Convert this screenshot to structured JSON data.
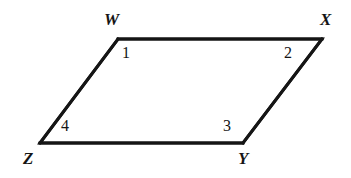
{
  "figure": {
    "kind": "geometry-diagram",
    "shape_name": "parallelogram",
    "background_color": "#ffffff",
    "stroke_color": "#151515",
    "stroke_width": 3,
    "canvas": {
      "width": 351,
      "height": 178
    },
    "vertices": [
      {
        "id": "W",
        "label": "W",
        "x": 118,
        "y": 39,
        "label_x": 104,
        "label_y": 11
      },
      {
        "id": "X",
        "label": "X",
        "x": 322,
        "y": 39,
        "label_x": 320,
        "label_y": 11
      },
      {
        "id": "Y",
        "label": "Y",
        "x": 243,
        "y": 143,
        "label_x": 238,
        "label_y": 150
      },
      {
        "id": "Z",
        "label": "Z",
        "x": 40,
        "y": 143,
        "label_x": 23,
        "label_y": 150
      }
    ],
    "outline_path": "M 118 39 L 322 39 L 243 143 L 40 143 Z",
    "edges": [
      {
        "id": "WX",
        "from": "W",
        "to": "X"
      },
      {
        "id": "XY",
        "from": "X",
        "to": "Y"
      },
      {
        "id": "YZ",
        "from": "Y",
        "to": "Z"
      },
      {
        "id": "ZW",
        "from": "Z",
        "to": "W"
      }
    ],
    "angles": [
      {
        "id": "angle-1",
        "label": "1",
        "at_vertex": "W",
        "label_x": 122,
        "label_y": 45
      },
      {
        "id": "angle-2",
        "label": "2",
        "at_vertex": "X",
        "label_x": 284,
        "label_y": 45
      },
      {
        "id": "angle-3",
        "label": "3",
        "at_vertex": "Y",
        "label_x": 223,
        "label_y": 118
      },
      {
        "id": "angle-4",
        "label": "4",
        "at_vertex": "Z",
        "label_x": 61,
        "label_y": 118
      }
    ]
  }
}
